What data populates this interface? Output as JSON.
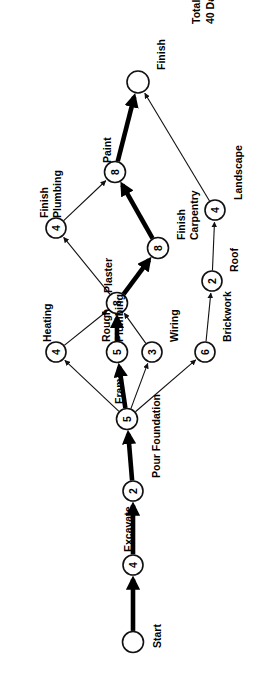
{
  "diagram": {
    "title_note": {
      "line1": "Total",
      "line2": "40 Days"
    },
    "orientation": "rotated-90-ccw",
    "nodes": [
      {
        "id": "start",
        "label": "Start",
        "duration": "",
        "x": 133,
        "y": 642,
        "r": 10.5,
        "terminal": true
      },
      {
        "id": "exc",
        "label": "Excavate",
        "duration": "4",
        "x": 133,
        "y": 565,
        "r": 10.0,
        "terminal": false
      },
      {
        "id": "pour",
        "label": "Pour Foundation",
        "duration": "2",
        "x": 133,
        "y": 491,
        "r": 10.0,
        "terminal": false
      },
      {
        "id": "frame",
        "label": "Frame",
        "duration": "5",
        "x": 127,
        "y": 419,
        "r": 10.5,
        "terminal": false
      },
      {
        "id": "heat",
        "label": "Heating",
        "duration": "4",
        "x": 56,
        "y": 352,
        "r": 10.0,
        "terminal": false
      },
      {
        "id": "rplumb",
        "label": "Rough\nPlumbing",
        "duration": "5",
        "x": 117,
        "y": 352,
        "r": 10.5,
        "terminal": false
      },
      {
        "id": "wiring",
        "label": "Wiring",
        "duration": "3",
        "x": 152,
        "y": 352,
        "r": 10.0,
        "terminal": false
      },
      {
        "id": "brick",
        "label": "Brickwork",
        "duration": "6",
        "x": 205,
        "y": 352,
        "r": 10.0,
        "terminal": false
      },
      {
        "id": "plaster",
        "label": "Plaster",
        "duration": "8",
        "x": 117,
        "y": 303,
        "r": 10.5,
        "terminal": false
      },
      {
        "id": "roof",
        "label": "Roof",
        "duration": "2",
        "x": 212,
        "y": 281,
        "r": 10.0,
        "terminal": false
      },
      {
        "id": "fplumb",
        "label": "Finish\nPlumbing",
        "duration": "4",
        "x": 56,
        "y": 228,
        "r": 10.0,
        "terminal": false
      },
      {
        "id": "fcarp",
        "label": "Finish\nCarpentry",
        "duration": "8",
        "x": 158,
        "y": 248,
        "r": 10.5,
        "terminal": false
      },
      {
        "id": "land",
        "label": "Landscape",
        "duration": "4",
        "x": 215,
        "y": 210,
        "r": 10.0,
        "terminal": false
      },
      {
        "id": "paint",
        "label": "Paint",
        "duration": "8",
        "x": 115,
        "y": 172,
        "r": 10.5,
        "terminal": false
      },
      {
        "id": "finish",
        "label": "Finish",
        "duration": "",
        "x": 138,
        "y": 82,
        "r": 11.0,
        "terminal": true
      }
    ],
    "edges": [
      {
        "from": "start",
        "to": "exc",
        "critical": true
      },
      {
        "from": "exc",
        "to": "pour",
        "critical": true
      },
      {
        "from": "pour",
        "to": "frame",
        "critical": true
      },
      {
        "from": "frame",
        "to": "heat",
        "critical": false
      },
      {
        "from": "frame",
        "to": "rplumb",
        "critical": true
      },
      {
        "from": "frame",
        "to": "wiring",
        "critical": false
      },
      {
        "from": "frame",
        "to": "brick",
        "critical": false
      },
      {
        "from": "heat",
        "to": "plaster",
        "critical": false
      },
      {
        "from": "rplumb",
        "to": "plaster",
        "critical": true
      },
      {
        "from": "wiring",
        "to": "plaster",
        "critical": false
      },
      {
        "from": "brick",
        "to": "roof",
        "critical": false
      },
      {
        "from": "roof",
        "to": "land",
        "critical": false
      },
      {
        "from": "plaster",
        "to": "fplumb",
        "critical": false
      },
      {
        "from": "plaster",
        "to": "fcarp",
        "critical": true
      },
      {
        "from": "fplumb",
        "to": "paint",
        "critical": false
      },
      {
        "from": "fcarp",
        "to": "paint",
        "critical": true
      },
      {
        "from": "paint",
        "to": "finish",
        "critical": true
      },
      {
        "from": "land",
        "to": "finish",
        "critical": false
      }
    ],
    "node_labels": {
      "start": {
        "text": "Start",
        "x": 151,
        "y": 648,
        "lines": 1
      },
      "exc": {
        "text": "Excavate",
        "x": 122,
        "y": 552,
        "lines": 1
      },
      "pour": {
        "text": "Pour Foundation",
        "x": 150,
        "y": 478,
        "lines": 1
      },
      "frame": {
        "text": "Frame",
        "x": 113,
        "y": 404,
        "lines": 1
      },
      "heat": {
        "text": "Heating",
        "x": 41,
        "y": 342,
        "lines": 1
      },
      "rplumb": {
        "text": "Rough Plumbing",
        "x": 100,
        "y": 342,
        "lines": 2
      },
      "wiring": {
        "text": "Wiring",
        "x": 168,
        "y": 342,
        "lines": 1
      },
      "brick": {
        "text": "Brickwork",
        "x": 221,
        "y": 342,
        "lines": 1
      },
      "plaster": {
        "text": "Plaster",
        "x": 102,
        "y": 293,
        "lines": 1
      },
      "roof": {
        "text": "Roof",
        "x": 228,
        "y": 272,
        "lines": 1
      },
      "fplumb": {
        "text": "Finish Plumbing",
        "x": 38,
        "y": 218,
        "lines": 2
      },
      "fcarp": {
        "text": "Finish Carpentry",
        "x": 175,
        "y": 240,
        "lines": 2
      },
      "land": {
        "text": "Landscape",
        "x": 232,
        "y": 200,
        "lines": 1
      },
      "paint": {
        "text": "Paint",
        "x": 101,
        "y": 163,
        "lines": 1
      },
      "finish": {
        "text": "Finish",
        "x": 155,
        "y": 70,
        "lines": 1
      }
    }
  }
}
